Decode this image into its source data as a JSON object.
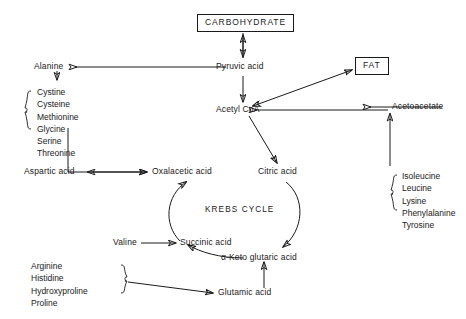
{
  "diagram": {
    "cycle_label": "KREBS CYCLE",
    "stroke_color": "#1a1a1a",
    "background_color": "#ffffff"
  },
  "nodes": {
    "carbohydrate": "CARBOHYDRATE",
    "fat": "FAT",
    "pyruvic_acid": "Pyruvic acid",
    "acetyl_coa": "Acetyl CoA",
    "alanine": "Alanine",
    "acetoacetate": "Acetoacetate",
    "aspartic_acid": "Aspartic acid",
    "oxalacetic_acid": "Oxalacetic acid",
    "citric_acid": "Citric acid",
    "valine": "Valine",
    "succinic_acid": "Succinic acid",
    "keto_glutaric_acid": "α-Keto glutaric acid",
    "glutamic_acid": "Glutamic acid"
  },
  "groups": {
    "oxalacetic_precursors": {
      "items": [
        "Cystine",
        "Cysteine",
        "Methionine",
        "Glycine",
        "Serine",
        "Threonine"
      ]
    },
    "acetyl_coa_precursors": {
      "items": [
        "Isoleucine",
        "Leucine",
        "Lysine",
        "Phenylalanine",
        "Tyrosine"
      ]
    },
    "glutamic_precursors": {
      "items": [
        "Arginine",
        "Histidine",
        "Hydroxyproline",
        "Proline"
      ]
    }
  }
}
